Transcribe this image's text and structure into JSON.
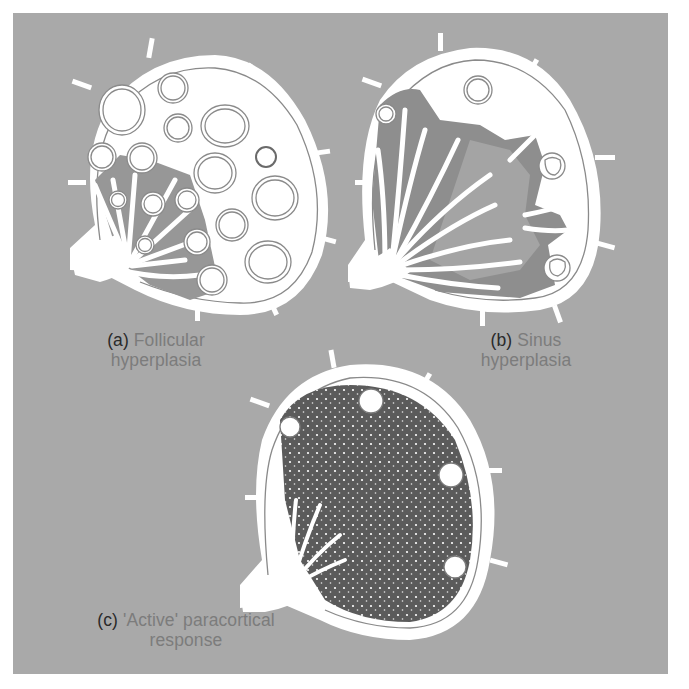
{
  "figure": {
    "background_color": "#a9a9a9",
    "node_fill_color": "#ffffff",
    "medulla_shade_color": "#8e8e8e",
    "paracortex_dark_color": "#5a5a5a",
    "panels": [
      {
        "id": "a",
        "tag": "(a)",
        "title_line1": "Follicular",
        "title_line2": "hyperplasia",
        "illustration": "lymph-node-follicular-hyperplasia"
      },
      {
        "id": "b",
        "tag": "(b)",
        "title_line1": "Sinus",
        "title_line2": "hyperplasia",
        "illustration": "lymph-node-sinus-hyperplasia"
      },
      {
        "id": "c",
        "tag": "(c)",
        "title_line1": "'Active' paracortical",
        "title_line2": "response",
        "illustration": "lymph-node-paracortical-response"
      }
    ]
  }
}
